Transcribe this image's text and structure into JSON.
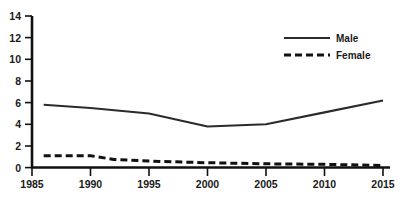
{
  "chart_data": {
    "type": "line",
    "title": "",
    "subtitle": "",
    "xlabel": "",
    "ylabel": "",
    "x": [
      1986,
      1990,
      1992,
      1995,
      2000,
      2005,
      2010,
      2015
    ],
    "xlim": [
      1985,
      2015
    ],
    "ylim": [
      0,
      14
    ],
    "xticks": [
      1985,
      1990,
      1995,
      2000,
      2005,
      2010,
      2015
    ],
    "yticks": [
      0,
      2,
      4,
      6,
      8,
      10,
      12,
      14
    ],
    "grid": false,
    "legend_position": "top-right",
    "series": [
      {
        "name": "Male",
        "style": "solid",
        "color": "#2b2b2b",
        "x": [
          1986,
          1990,
          1995,
          2000,
          2005,
          2010,
          2015
        ],
        "values": [
          5.8,
          5.5,
          5.0,
          3.8,
          4.0,
          5.1,
          6.2
        ]
      },
      {
        "name": "Female",
        "style": "dashed",
        "color": "#111111",
        "x": [
          1986,
          1990,
          1992,
          1995,
          2000,
          2005,
          2010,
          2015
        ],
        "values": [
          1.1,
          1.1,
          0.75,
          0.6,
          0.45,
          0.35,
          0.3,
          0.2
        ]
      }
    ]
  },
  "axes": {
    "x_tick_labels": [
      "1985",
      "1990",
      "1995",
      "2000",
      "2005",
      "2010",
      "2015"
    ],
    "y_tick_labels": [
      "0",
      "2",
      "4",
      "6",
      "8",
      "10",
      "12",
      "14"
    ]
  },
  "legend": {
    "items": [
      {
        "label": "Male",
        "style": "solid"
      },
      {
        "label": "Female",
        "style": "dashed"
      }
    ]
  }
}
